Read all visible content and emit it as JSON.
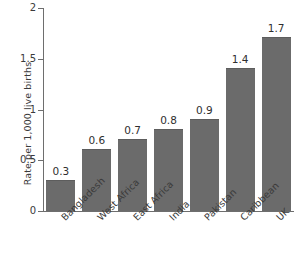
{
  "chart_data": {
    "type": "bar",
    "title": "",
    "xlabel": "",
    "ylabel": "Rate per 1,000 live births",
    "ylim": [
      0,
      2
    ],
    "yticks": [
      "0",
      "0.5",
      "1",
      "1.5",
      "2"
    ],
    "ytick_values": [
      0,
      0.5,
      1,
      1.5,
      2
    ],
    "grid": false,
    "legend": false,
    "bar_color": "#6b6b6b",
    "axis_color": "#6e6e6e",
    "background": "#ffffff",
    "value_label_format": "0.0",
    "xtick_rotation": -45,
    "categories": [
      "Bangladesh",
      "West Africa",
      "East Africa",
      "India",
      "Pakistan",
      "Caribbean",
      "UK"
    ],
    "values": [
      0.3,
      0.6,
      0.7,
      0.8,
      0.9,
      1.4,
      1.7
    ],
    "value_labels": [
      "0.3",
      "0.6",
      "0.7",
      "0.8",
      "0.9",
      "1.4",
      "1.7"
    ]
  }
}
